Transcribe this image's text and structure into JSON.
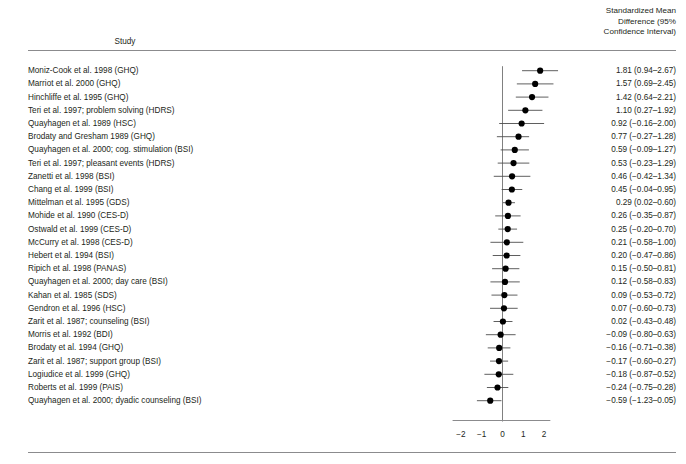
{
  "header": {
    "study_column": "Study",
    "value_column_line1": "Standardized Mean",
    "value_column_line2": "Difference (95%",
    "value_column_line3": "Confidence Interval)"
  },
  "axis": {
    "tick_labels": [
      "−2",
      "−1",
      "0",
      "1",
      "2"
    ],
    "tick_values": [
      -2,
      -1,
      0,
      1,
      2
    ],
    "null_line_value": 0
  },
  "chart_data": {
    "type": "forest",
    "title": "",
    "xlabel": "",
    "ylabel": "",
    "xlim": [
      -2.6,
      2.75
    ],
    "grid": false,
    "legend": "none",
    "null_line": 0,
    "categories": [
      "Moniz-Cook et al. 1998 (GHQ)",
      "Marriot et al. 2000 (GHQ)",
      "Hinchliffe et al. 1995 (GHQ)",
      "Teri et al. 1997; problem solving (HDRS)",
      "Quayhagen et al. 1989 (HSC)",
      "Brodaty and Gresham 1989 (GHQ)",
      "Quayhagen et al. 2000; cog. stimulation (BSI)",
      "Teri et al. 1997; pleasant events (HDRS)",
      "Zanetti et al. 1998 (BSI)",
      "Chang et al. 1999 (BSI)",
      "Mittelman et al. 1995 (GDS)",
      "Mohide et al. 1990 (CES-D)",
      "Ostwald et al. 1999 (CES-D)",
      "McCurry et al. 1998 (CES-D)",
      "Hebert et al. 1994 (BSI)",
      "Ripich et al. 1998 (PANAS)",
      "Quayhagen et al. 2000; day care (BSI)",
      "Kahan et al. 1985 (SDS)",
      "Gendron et al. 1996 (HSC)",
      "Zarit et al. 1987; counseling (BSI)",
      "Morris et al. 1992 (BDI)",
      "Brodaty et al. 1994 (GHQ)",
      "Zarit et al. 1987; support group (BSI)",
      "Logiudice et al. 1999 (GHQ)",
      "Roberts et al. 1999 (PAIS)",
      "Quayhagen et al. 2000; dyadic counseling (BSI)"
    ],
    "values": [
      1.81,
      1.57,
      1.42,
      1.1,
      0.92,
      0.77,
      0.59,
      0.53,
      0.46,
      0.45,
      0.29,
      0.26,
      0.25,
      0.21,
      0.2,
      0.15,
      0.12,
      0.09,
      0.07,
      0.02,
      -0.09,
      -0.16,
      -0.17,
      -0.18,
      -0.24,
      -0.59
    ],
    "ci_low": [
      0.94,
      0.69,
      0.64,
      0.27,
      -0.16,
      -0.27,
      -0.09,
      -0.23,
      -0.42,
      -0.04,
      0.02,
      -0.35,
      -0.2,
      -0.58,
      -0.47,
      -0.5,
      -0.58,
      -0.53,
      -0.6,
      -0.43,
      -0.8,
      -0.71,
      -0.6,
      -0.87,
      -0.75,
      -1.23
    ],
    "ci_high": [
      2.67,
      2.45,
      2.21,
      1.92,
      2.0,
      1.28,
      1.27,
      1.29,
      1.34,
      0.95,
      0.6,
      0.87,
      0.7,
      1.0,
      0.86,
      0.81,
      0.83,
      0.72,
      0.73,
      0.48,
      0.63,
      0.38,
      0.27,
      0.52,
      0.28,
      -0.05
    ],
    "value_labels": [
      "1.81 (0.94–2.67)",
      "1.57 (0.69–2.45)",
      "1.42 (0.64–2.21)",
      "1.10 (0.27–1.92)",
      "0.92 (−0.16–2.00)",
      "0.77 (−0.27–1.28)",
      "0.59 (−0.09–1.27)",
      "0.53 (−0.23–1.29)",
      "0.46 (−0.42–1.34)",
      "0.45 (−0.04–0.95)",
      "0.29 (0.02–0.60)",
      "0.26 (−0.35–0.87)",
      "0.25 (−0.20–0.70)",
      "0.21 (−0.58–1.00)",
      "0.20 (−0.47–0.86)",
      "0.15 (−0.50–0.81)",
      "0.12 (−0.58–0.83)",
      "0.09 (−0.53–0.72)",
      "0.07 (−0.60–0.73)",
      "0.02 (−0.43–0.48)",
      "−0.09 (−0.80–0.63)",
      "−0.16 (−0.71–0.38)",
      "−0.17 (−0.60–0.27)",
      "−0.18 (−0.87–0.52)",
      "−0.24 (−0.75–0.28)",
      "−0.59 (−1.23–0.05)"
    ]
  },
  "colors": {
    "text": "#231f20",
    "rule": "#8b8b8d",
    "marker": "#000000",
    "ci_line": "#4d4d4d",
    "null_line": "#808080",
    "axis_line": "#8b8b8d"
  }
}
